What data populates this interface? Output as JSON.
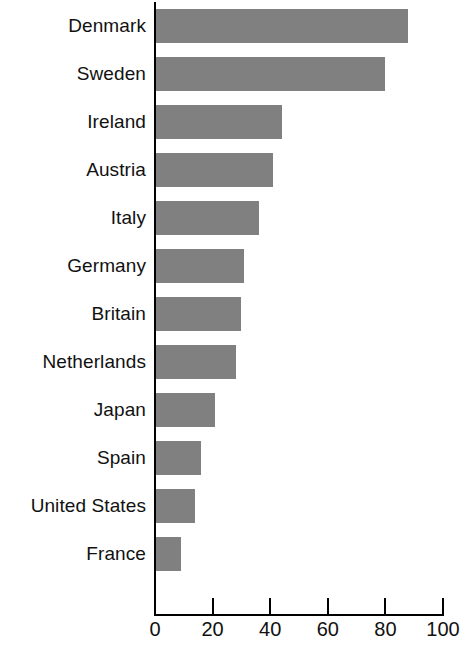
{
  "chart_data": {
    "type": "bar",
    "orientation": "horizontal",
    "title": "",
    "subtitle": "",
    "xlabel": "",
    "ylabel": "",
    "xlim": [
      0,
      100
    ],
    "grid": false,
    "legend": null,
    "xticks": [
      "0",
      "20",
      "40",
      "60",
      "80",
      "100"
    ],
    "xtick_values": [
      0,
      20,
      40,
      60,
      80,
      100
    ],
    "bar_color": "#808080",
    "axis_color": "#000000",
    "background": "#ffffff",
    "categories": [
      "Denmark",
      "Sweden",
      "Ireland",
      "Austria",
      "Italy",
      "Germany",
      "Britain",
      "Netherlands",
      "Japan",
      "Spain",
      "United States",
      "France"
    ],
    "values": [
      88,
      80,
      44,
      41,
      36,
      31,
      30,
      28,
      21,
      16,
      14,
      9
    ]
  }
}
